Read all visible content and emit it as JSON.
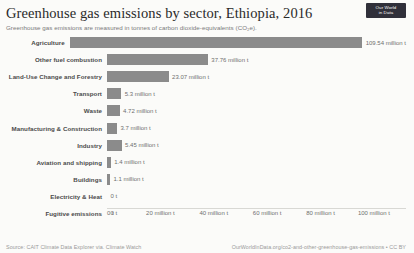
{
  "header": {
    "title": "Greenhouse gas emissions by sector, Ethiopia, 2016",
    "subtitle": "Greenhouse gas emissions are measured in tonnes of carbon dioxide-equivalents (CO₂e).",
    "logo_line1": "Our World",
    "logo_line2": "in Data"
  },
  "footer": {
    "source": "Source: CAIT Climate Data Explorer via. Climate Watch",
    "link": "OurWorldInData.org/co2-and-other-greenhouse-gas-emissions • CC BY"
  },
  "colors": {
    "bar": "#8b8b8b",
    "background": "#fbfbf9",
    "text": "#4a4a4a"
  },
  "chart_data": {
    "type": "bar",
    "orientation": "horizontal",
    "title": "Greenhouse gas emissions by sector, Ethiopia, 2016",
    "subtitle": "Greenhouse gas emissions are measured in tonnes of carbon dioxide-equivalents (CO₂e).",
    "xlabel": "",
    "ylabel": "",
    "xlim": [
      0,
      115
    ],
    "unit": "million tonnes CO₂e",
    "grid": false,
    "legend": false,
    "ticks": [
      {
        "value": 0,
        "label": "0 t"
      },
      {
        "value": 20,
        "label": "20 million t"
      },
      {
        "value": 40,
        "label": "40 million t"
      },
      {
        "value": 60,
        "label": "60 million t"
      },
      {
        "value": 80,
        "label": "80 million t"
      },
      {
        "value": 100,
        "label": "100 million t"
      }
    ],
    "categories": [
      "Agriculture",
      "Other fuel combustion",
      "Land-Use Change and Forestry",
      "Transport",
      "Waste",
      "Manufacturing & Construction",
      "Industry",
      "Aviation and shipping",
      "Buildings",
      "Electricity & Heat",
      "Fugitive emissions"
    ],
    "values": [
      109.54,
      37.76,
      23.07,
      5.3,
      4.72,
      3.7,
      5.45,
      1.4,
      1.1,
      0,
      0
    ],
    "value_labels": [
      "109.54 million t",
      "37.76 million t",
      "23.07 million t",
      "5.3 million t",
      "4.72 million t",
      "3.7 million t",
      "5.45 million t",
      "1.4 million t",
      "1.1 million t",
      "0 t",
      "0 t"
    ]
  }
}
